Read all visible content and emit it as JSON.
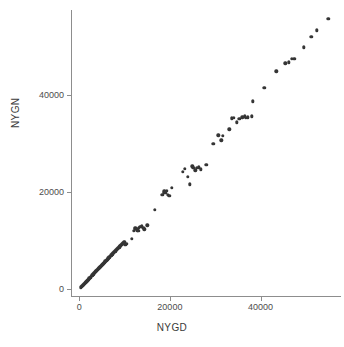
{
  "chart_data": {
    "type": "scatter",
    "title": "",
    "xlabel": "NYGD",
    "ylabel": "NYGN",
    "xlim": [
      -1800,
      57500
    ],
    "ylim": [
      -1500,
      57000
    ],
    "grid": false,
    "legend": null,
    "x_ticks": [
      {
        "value": 0,
        "label": "0"
      },
      {
        "value": 20000,
        "label": "20000"
      },
      {
        "value": 40000,
        "label": "40000"
      }
    ],
    "y_ticks": [
      {
        "value": 0,
        "label": "0"
      },
      {
        "value": 20000,
        "label": "20000"
      },
      {
        "value": 40000,
        "label": "40000"
      }
    ],
    "series": [
      {
        "name": "NYGN vs NYGD",
        "marker": "filled-circle",
        "color": "#353535",
        "points": [
          [
            420,
            300
          ],
          [
            560,
            430
          ],
          [
            700,
            560
          ],
          [
            840,
            700
          ],
          [
            960,
            800
          ],
          [
            1080,
            930
          ],
          [
            1200,
            1050
          ],
          [
            1320,
            1180
          ],
          [
            1450,
            1300
          ],
          [
            1560,
            1420
          ],
          [
            1680,
            1540
          ],
          [
            1800,
            1660
          ],
          [
            1900,
            1760
          ],
          [
            2020,
            1880
          ],
          [
            2140,
            2010
          ],
          [
            2260,
            2120
          ],
          [
            2380,
            2250
          ],
          [
            2500,
            2370
          ],
          [
            2620,
            2480
          ],
          [
            2740,
            2620
          ],
          [
            2860,
            2740
          ],
          [
            2980,
            2850
          ],
          [
            3100,
            2970
          ],
          [
            3220,
            3100
          ],
          [
            3340,
            3220
          ],
          [
            3460,
            3340
          ],
          [
            3580,
            3450
          ],
          [
            3700,
            3580
          ],
          [
            3820,
            3700
          ],
          [
            3940,
            3810
          ],
          [
            4060,
            3940
          ],
          [
            4180,
            4060
          ],
          [
            4300,
            4170
          ],
          [
            4420,
            4290
          ],
          [
            4560,
            4420
          ],
          [
            4680,
            4540
          ],
          [
            4800,
            4650
          ],
          [
            4940,
            4790
          ],
          [
            5060,
            4900
          ],
          [
            5180,
            5020
          ],
          [
            5300,
            5150
          ],
          [
            5420,
            5280
          ],
          [
            5560,
            5400
          ],
          [
            5680,
            5520
          ],
          [
            5800,
            5640
          ],
          [
            5920,
            5760
          ],
          [
            6040,
            5890
          ],
          [
            6180,
            6000
          ],
          [
            6300,
            6130
          ],
          [
            6420,
            6250
          ],
          [
            6560,
            6380
          ],
          [
            6680,
            6490
          ],
          [
            6800,
            6620
          ],
          [
            6940,
            6740
          ],
          [
            7060,
            6870
          ],
          [
            7180,
            6990
          ],
          [
            7320,
            7110
          ],
          [
            7440,
            7230
          ],
          [
            7560,
            7360
          ],
          [
            7700,
            7480
          ],
          [
            7820,
            7600
          ],
          [
            7960,
            7720
          ],
          [
            8080,
            7850
          ],
          [
            8200,
            7970
          ],
          [
            8340,
            8080
          ],
          [
            8460,
            8210
          ],
          [
            8580,
            8330
          ],
          [
            8720,
            8450
          ],
          [
            8840,
            8570
          ],
          [
            8960,
            8700
          ],
          [
            9100,
            8820
          ],
          [
            9220,
            8940
          ],
          [
            9340,
            9060
          ],
          [
            9480,
            9190
          ],
          [
            9600,
            9300
          ],
          [
            9720,
            9430
          ],
          [
            9850,
            9550
          ],
          [
            10050,
            9680
          ],
          [
            10200,
            9100
          ],
          [
            10400,
            9200
          ],
          [
            11600,
            10300
          ],
          [
            12000,
            11900
          ],
          [
            12200,
            12400
          ],
          [
            12400,
            12600
          ],
          [
            12600,
            12300
          ],
          [
            12800,
            12000
          ],
          [
            13000,
            11900
          ],
          [
            13200,
            12500
          ],
          [
            13500,
            12700
          ],
          [
            13800,
            12900
          ],
          [
            14100,
            12600
          ],
          [
            14400,
            12200
          ],
          [
            15000,
            13100
          ],
          [
            16700,
            16200
          ],
          [
            18300,
            19300
          ],
          [
            18600,
            19800
          ],
          [
            18800,
            20100
          ],
          [
            19000,
            19700
          ],
          [
            19300,
            20200
          ],
          [
            19600,
            19300
          ],
          [
            19900,
            19200
          ],
          [
            20400,
            20800
          ],
          [
            22800,
            24100
          ],
          [
            23300,
            24700
          ],
          [
            24000,
            23000
          ],
          [
            24400,
            21500
          ],
          [
            24900,
            25200
          ],
          [
            25200,
            24900
          ],
          [
            25600,
            24400
          ],
          [
            26000,
            24900
          ],
          [
            26400,
            25000
          ],
          [
            26800,
            24600
          ],
          [
            28000,
            25500
          ],
          [
            29600,
            29900
          ],
          [
            30700,
            31600
          ],
          [
            31300,
            30600
          ],
          [
            31700,
            31500
          ],
          [
            33100,
            32800
          ],
          [
            33600,
            35100
          ],
          [
            34100,
            35200
          ],
          [
            34700,
            34300
          ],
          [
            35300,
            35000
          ],
          [
            36000,
            35300
          ],
          [
            36500,
            35500
          ],
          [
            36800,
            35200
          ],
          [
            37200,
            35300
          ],
          [
            38000,
            35500
          ],
          [
            38300,
            38600
          ],
          [
            40800,
            41400
          ],
          [
            43500,
            44800
          ],
          [
            45400,
            46400
          ],
          [
            46200,
            46600
          ],
          [
            46900,
            47300
          ],
          [
            47400,
            47400
          ],
          [
            49500,
            49700
          ],
          [
            51200,
            51900
          ],
          [
            52400,
            53200
          ],
          [
            54900,
            55600
          ]
        ]
      }
    ]
  }
}
